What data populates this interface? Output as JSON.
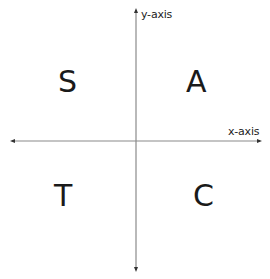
{
  "diagram": {
    "axes": {
      "x_label": "x-axis",
      "y_label": "y-axis",
      "line_color": "#8a8a8a",
      "arrow_color": "#333333"
    },
    "quadrants": {
      "top_left": "S",
      "top_right": "A",
      "bottom_left": "T",
      "bottom_right": "C"
    }
  }
}
